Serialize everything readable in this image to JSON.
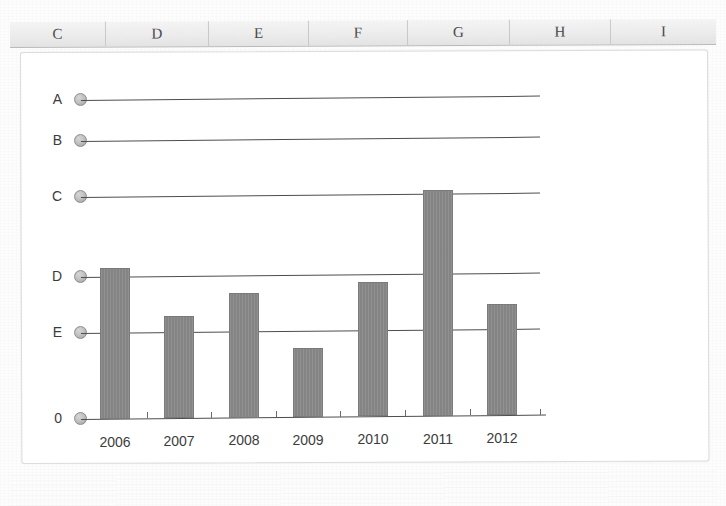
{
  "spreadsheet_header": {
    "columns": [
      {
        "label": "C",
        "width": 96
      },
      {
        "label": "D",
        "width": 103
      },
      {
        "label": "E",
        "width": 100
      },
      {
        "label": "F",
        "width": 99
      },
      {
        "label": "G",
        "width": 102
      },
      {
        "label": "H",
        "width": 101
      },
      {
        "label": "I",
        "width": 105
      }
    ]
  },
  "colors": {
    "bar": "#848484",
    "bar_border": "#7a7a7a",
    "axis": "#4d4d4d",
    "marker": "#bdbdbd",
    "panel_background": "#ffffff",
    "header_background": "#ececec",
    "text": "#3c3c3c"
  },
  "chart_data": {
    "type": "bar",
    "title": "",
    "xlabel": "",
    "ylabel": "",
    "grid": true,
    "legend": "none",
    "categories": [
      "2006",
      "2007",
      "2008",
      "2009",
      "2010",
      "2011",
      "2012"
    ],
    "values": [
      4.12,
      2.93,
      3.49,
      2.0,
      3.79,
      5.98,
      3.25
    ],
    "ytick_labels": [
      "A",
      "B",
      "C",
      "D",
      "E",
      "0"
    ],
    "ytick_values": [
      8,
      7,
      6,
      4,
      3,
      0
    ],
    "ylim": [
      0,
      8.6
    ],
    "series": [
      {
        "name": "series-1",
        "values": [
          4.12,
          2.93,
          3.49,
          2.0,
          3.79,
          5.98,
          3.25
        ]
      }
    ]
  },
  "plot_geometry": {
    "baseline_y": 419,
    "plot_left_x": 81,
    "plot_right_x": 540,
    "bar_width": 30,
    "ytick_pixel_y": [
      100,
      141,
      197,
      277,
      333,
      419
    ],
    "bar_left_x": [
      100,
      164,
      229,
      293,
      358,
      423,
      487
    ],
    "bar_top_y": [
      268,
      317,
      294,
      350,
      285,
      193,
      308
    ],
    "xlabel_y": 434,
    "xlabel_center_x": [
      115,
      179,
      244,
      308,
      373,
      438,
      502
    ]
  }
}
